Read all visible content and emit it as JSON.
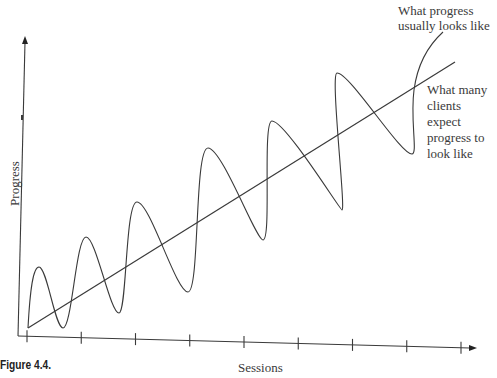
{
  "caption": "Figure 4.4.",
  "chart_data": {
    "type": "line",
    "title": "",
    "xlabel": "Sessions",
    "ylabel": "Progress",
    "x_ticks": 9,
    "grid": false,
    "series": [
      {
        "name": "What many clients expect progress to look like",
        "shape": "straight line",
        "points": [
          [
            0,
            0
          ],
          [
            9,
            9
          ]
        ]
      },
      {
        "name": "What progress usually looks like",
        "shape": "oscillating upward wave",
        "peaks": [
          2.0,
          3.1,
          4.2,
          5.8,
          6.9,
          8.6
        ],
        "troughs": [
          0.0,
          0.5,
          1.0,
          1.2,
          3.2,
          3.6,
          5.8
        ]
      }
    ],
    "annotations": [
      {
        "text_lines": [
          "What progress",
          "usually looks like"
        ],
        "target": "wavy curve"
      },
      {
        "text_lines": [
          "What many",
          "clients expect",
          "progress to",
          "look like"
        ],
        "target": "straight line"
      }
    ]
  }
}
